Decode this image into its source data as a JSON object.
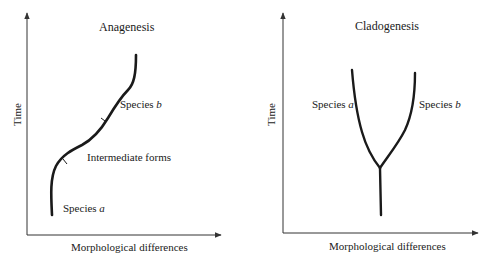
{
  "panels": [
    {
      "title": "Anagenesis",
      "y_axis_label": "Time",
      "x_axis_label": "Morphological differences",
      "labels": {
        "species_b_prefix": "Species ",
        "species_b_letter": "b",
        "intermediate": "Intermediate forms",
        "species_a_prefix": "Species ",
        "species_a_letter": "a"
      }
    },
    {
      "title": "Cladogenesis",
      "y_axis_label": "Time",
      "x_axis_label": "Morphological differences",
      "labels": {
        "species_a_prefix": "Species ",
        "species_a_letter": "a",
        "species_b_prefix": "Species ",
        "species_b_letter": "b"
      }
    }
  ],
  "colors": {
    "line": "#1a1a1a",
    "axis": "#333333",
    "background": "#ffffff"
  }
}
